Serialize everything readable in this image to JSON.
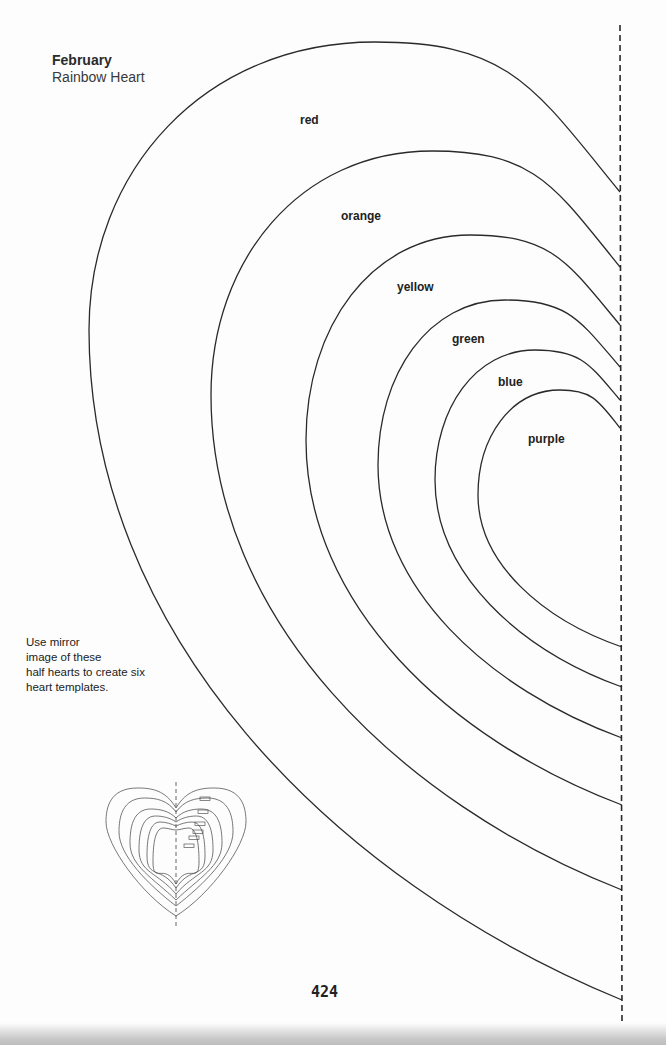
{
  "header": {
    "month": "February",
    "title": "Rainbow Heart"
  },
  "instructions": {
    "lines": [
      "Use mirror",
      "image of these",
      "half hearts to create six",
      "heart templates."
    ]
  },
  "hearts": [
    {
      "label": "red"
    },
    {
      "label": "orange"
    },
    {
      "label": "yellow"
    },
    {
      "label": "green"
    },
    {
      "label": "blue"
    },
    {
      "label": "purple"
    }
  ],
  "fold_line": {
    "style": "dashed"
  },
  "preview": {
    "description": "nested full hearts diagram",
    "count": 6
  },
  "footer": {
    "page_number": "424"
  }
}
